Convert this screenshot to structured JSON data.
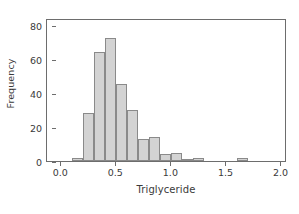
{
  "chart_data": {
    "type": "bar",
    "title": "",
    "subtitle": "",
    "xlabel": "Triglyceride",
    "ylabel": "Frequency",
    "xlim": [
      -0.13,
      2.05
    ],
    "ylim": [
      0,
      84
    ],
    "grid": false,
    "legend": null,
    "bin_width": 0.1,
    "xticks": [
      "0.0",
      "0.5",
      "1.0",
      "1.5",
      "2.0"
    ],
    "xtick_values": [
      0.0,
      0.5,
      1.0,
      1.5,
      2.0
    ],
    "yticks": [
      "0",
      "20",
      "40",
      "60",
      "80"
    ],
    "ytick_values": [
      0,
      20,
      40,
      60,
      80
    ],
    "bin_starts": [
      0.1,
      0.2,
      0.3,
      0.4,
      0.5,
      0.6,
      0.7,
      0.8,
      0.9,
      1.0,
      1.1,
      1.2,
      1.6
    ],
    "bin_ends": [
      0.2,
      0.3,
      0.4,
      0.5,
      0.6,
      0.7,
      0.8,
      0.9,
      1.0,
      1.1,
      1.2,
      1.3,
      1.7
    ],
    "categories": [
      "0.1-0.2",
      "0.2-0.3",
      "0.3-0.4",
      "0.4-0.5",
      "0.5-0.6",
      "0.6-0.7",
      "0.7-0.8",
      "0.8-0.9",
      "0.9-1.0",
      "1.0-1.1",
      "1.1-1.2",
      "1.2-1.3",
      "1.6-1.7"
    ],
    "values": [
      2,
      28,
      64,
      72,
      45,
      30,
      13,
      14,
      4,
      5,
      1,
      2,
      2
    ],
    "bar_fill": "#d3d3d3",
    "bar_edge": "#8a8a8a",
    "axis_color": "#6d6d6d",
    "text_color": "#3a3a3a"
  }
}
